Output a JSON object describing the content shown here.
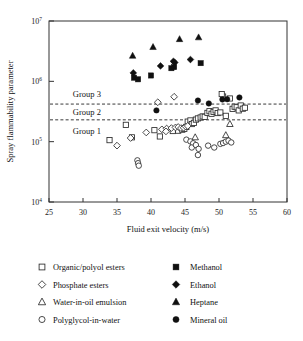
{
  "chart_data": {
    "type": "scatter",
    "title": "",
    "xlabel": "Fluid exit velocity (m/s)",
    "ylabel": "Spray flammability parameter",
    "xlim": [
      25,
      60
    ],
    "ylim": [
      10000,
      10000000
    ],
    "yscale": "log",
    "xticks": [
      25,
      30,
      35,
      40,
      45,
      50,
      55,
      60
    ],
    "yticks": [
      "10^4",
      "10^5",
      "10^6",
      "10^7"
    ],
    "ytick_labels": [
      "10",
      "10",
      "10",
      "10"
    ],
    "ytick_exponents": [
      "4",
      "5",
      "6",
      "7"
    ],
    "grid": false,
    "legend_position": "below-plot",
    "annotations": [
      {
        "label": "Group 3",
        "x": 28.5,
        "y": 620000
      },
      {
        "label": "Group 2",
        "x": 28.5,
        "y": 310000
      },
      {
        "label": "Group 1",
        "x": 28.5,
        "y": 150000
      }
    ],
    "threshold_lines": [
      {
        "name": "group3-threshold",
        "y": 420000,
        "style": "dashed"
      },
      {
        "name": "group2-threshold",
        "y": 230000,
        "style": "dashed"
      }
    ],
    "series": [
      {
        "name": "Organic/polyol esters",
        "marker": "open-square",
        "points": [
          [
            33.9,
            106000
          ],
          [
            36.3,
            190000
          ],
          [
            37.2,
            118000
          ],
          [
            40.5,
            155000
          ],
          [
            41.3,
            122000
          ],
          [
            43.2,
            150000
          ],
          [
            44.0,
            152000
          ],
          [
            44.6,
            158000
          ],
          [
            44.9,
            163000
          ],
          [
            45.2,
            175000
          ],
          [
            45.4,
            215000
          ],
          [
            45.8,
            225000
          ],
          [
            46.0,
            196000
          ],
          [
            46.3,
            205000
          ],
          [
            46.6,
            232000
          ],
          [
            46.9,
            243000
          ],
          [
            47.3,
            252000
          ],
          [
            47.6,
            262000
          ],
          [
            47.9,
            258000
          ],
          [
            48.3,
            300000
          ],
          [
            48.6,
            320000
          ],
          [
            48.9,
            290000
          ],
          [
            49.2,
            312000
          ],
          [
            49.5,
            330000
          ],
          [
            49.8,
            298000
          ],
          [
            50.2,
            305000
          ],
          [
            50.6,
            560000
          ],
          [
            51.0,
            268000
          ],
          [
            51.6,
            520000
          ],
          [
            52.0,
            350000
          ],
          [
            52.3,
            380000
          ],
          [
            52.6,
            372000
          ],
          [
            52.9,
            330000
          ],
          [
            53.2,
            398000
          ],
          [
            53.5,
            352000
          ],
          [
            53.8,
            365000
          ],
          [
            50.4,
            615000
          ]
        ]
      },
      {
        "name": "Phosphate esters",
        "marker": "open-diamond",
        "points": [
          [
            35.0,
            86000
          ],
          [
            37.0,
            115000
          ],
          [
            39.3,
            142000
          ],
          [
            41.0,
            450000
          ],
          [
            41.6,
            160000
          ],
          [
            42.3,
            165000
          ],
          [
            43.0,
            168000
          ],
          [
            43.6,
            172000
          ],
          [
            44.0,
            175000
          ],
          [
            44.4,
            168000
          ],
          [
            44.8,
            170000
          ],
          [
            45.1,
            178000
          ],
          [
            45.4,
            182000
          ],
          [
            43.4,
            555000
          ],
          [
            42.2,
            148000
          ]
        ]
      },
      {
        "name": "Water-in-oil emulsion",
        "marker": "open-triangle",
        "points": [
          [
            46.5,
            118000
          ],
          [
            51.0,
            128000
          ],
          [
            51.6,
            196000
          ]
        ]
      },
      {
        "name": "Polyglycol-in-water",
        "marker": "open-circle",
        "points": [
          [
            38.0,
            49000
          ],
          [
            38.1,
            44000
          ],
          [
            38.2,
            40000
          ],
          [
            45.2,
            108000
          ],
          [
            45.8,
            101000
          ],
          [
            46.2,
            94000
          ],
          [
            46.0,
            80000
          ],
          [
            46.6,
            88000
          ],
          [
            47.0,
            76000
          ],
          [
            48.4,
            86000
          ],
          [
            49.3,
            80000
          ],
          [
            50.2,
            92000
          ],
          [
            50.6,
            95000
          ],
          [
            51.0,
            100000
          ],
          [
            51.4,
            104000
          ],
          [
            51.8,
            97000
          ],
          [
            46.9,
            60000
          ]
        ]
      },
      {
        "name": "Methanol",
        "marker": "filled-square",
        "points": [
          [
            37.5,
            1150000
          ],
          [
            38.1,
            1080000
          ],
          [
            40.0,
            1250000
          ],
          [
            43.0,
            1650000
          ],
          [
            43.4,
            1720000
          ],
          [
            47.3,
            2000000
          ]
        ]
      },
      {
        "name": "Ethanol",
        "marker": "filled-diamond",
        "points": [
          [
            37.4,
            1380000
          ],
          [
            41.4,
            1800000
          ],
          [
            43.5,
            2050000
          ],
          [
            45.8,
            2300000
          ],
          [
            43.3,
            2150000
          ]
        ]
      },
      {
        "name": "Heptane",
        "marker": "filled-triangle",
        "points": [
          [
            37.3,
            2650000
          ],
          [
            40.3,
            3700000
          ],
          [
            44.2,
            5000000
          ],
          [
            47.0,
            5350000
          ]
        ]
      },
      {
        "name": "Mineral oil",
        "marker": "filled-circle",
        "points": [
          [
            40.8,
            330000
          ],
          [
            46.9,
            480000
          ],
          [
            48.5,
            430000
          ],
          [
            50.5,
            500000
          ],
          [
            51.2,
            505000
          ],
          [
            53.0,
            540000
          ]
        ]
      }
    ]
  },
  "legend": {
    "left_column": [
      {
        "label": "Organic/polyol esters",
        "marker": "open-square"
      },
      {
        "label": "Phosphate esters",
        "marker": "open-diamond"
      },
      {
        "label": "Water-in-oil emulsion",
        "marker": "open-triangle"
      },
      {
        "label": "Polyglycol-in-water",
        "marker": "open-circle"
      }
    ],
    "right_column": [
      {
        "label": "Methanol",
        "marker": "filled-square"
      },
      {
        "label": "Ethanol",
        "marker": "filled-diamond"
      },
      {
        "label": "Heptane",
        "marker": "filled-triangle"
      },
      {
        "label": "Mineral oil",
        "marker": "filled-circle"
      }
    ]
  },
  "colors": {
    "marker_stroke": "#2b2b2b",
    "marker_fill": "#101010",
    "axis": "#333333",
    "background": "#ffffff"
  }
}
